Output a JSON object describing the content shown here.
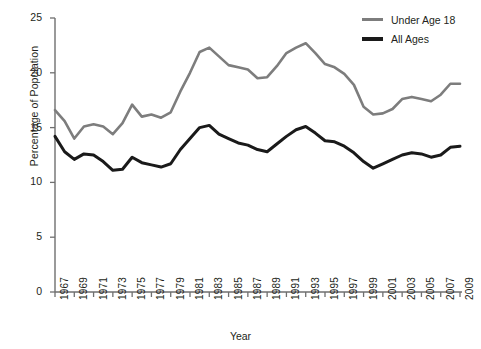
{
  "chart_data": {
    "type": "line",
    "title": "",
    "xlabel": "Year",
    "ylabel": "Percentage of Population",
    "xlim": [
      1967,
      2009
    ],
    "ylim": [
      0,
      25
    ],
    "yticks": [
      0,
      5,
      10,
      15,
      20,
      25
    ],
    "xticks": [
      1967,
      1969,
      1971,
      1973,
      1975,
      1977,
      1979,
      1981,
      1983,
      1985,
      1987,
      1989,
      1991,
      1993,
      1995,
      1997,
      1999,
      2001,
      2003,
      2005,
      2007,
      2009
    ],
    "grid": false,
    "legend_position": "top-right",
    "colors": {
      "under_age_18": "#7d7d7d",
      "all_ages": "#1a1a1a",
      "axis": "#231f20",
      "background": "#ffffff"
    },
    "x": [
      1967,
      1968,
      1969,
      1970,
      1971,
      1972,
      1973,
      1974,
      1975,
      1976,
      1977,
      1978,
      1979,
      1980,
      1981,
      1982,
      1983,
      1984,
      1985,
      1986,
      1987,
      1988,
      1989,
      1990,
      1991,
      1992,
      1993,
      1994,
      1995,
      1996,
      1997,
      1998,
      1999,
      2000,
      2001,
      2002,
      2003,
      2004,
      2005,
      2006,
      2007,
      2008,
      2009
    ],
    "series": [
      {
        "name": "Under Age 18",
        "color": "#7d7d7d",
        "values": [
          16.6,
          15.6,
          14.0,
          15.1,
          15.3,
          15.1,
          14.4,
          15.4,
          17.1,
          16.0,
          16.2,
          15.9,
          16.4,
          18.3,
          20.0,
          21.9,
          22.3,
          21.5,
          20.7,
          20.5,
          20.3,
          19.5,
          19.6,
          20.6,
          21.8,
          22.3,
          22.7,
          21.8,
          20.8,
          20.5,
          19.9,
          18.9,
          16.9,
          16.2,
          16.3,
          16.7,
          17.6,
          17.8,
          17.6,
          17.4,
          18.0,
          19.0,
          19.0
        ]
      },
      {
        "name": "All Ages",
        "color": "#1a1a1a",
        "values": [
          14.2,
          12.8,
          12.1,
          12.6,
          12.5,
          11.9,
          11.1,
          11.2,
          12.3,
          11.8,
          11.6,
          11.4,
          11.7,
          13.0,
          14.0,
          15.0,
          15.2,
          14.4,
          14.0,
          13.6,
          13.4,
          13.0,
          12.8,
          13.5,
          14.2,
          14.8,
          15.1,
          14.5,
          13.8,
          13.7,
          13.3,
          12.7,
          11.9,
          11.3,
          11.7,
          12.1,
          12.5,
          12.7,
          12.6,
          12.3,
          12.5,
          13.2,
          13.3
        ]
      }
    ]
  },
  "legend": {
    "items": [
      {
        "label": "Under Age 18",
        "swatch": "gray"
      },
      {
        "label": "All Ages",
        "swatch": "black"
      }
    ]
  },
  "axes": {
    "y_title": "Percentage of Population",
    "x_title": "Year"
  }
}
